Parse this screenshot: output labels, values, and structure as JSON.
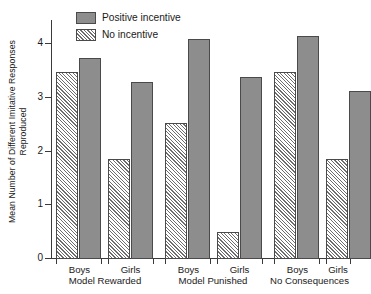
{
  "chart_data": {
    "type": "bar",
    "title": "",
    "subtitle": "",
    "xlabel": "",
    "ylabel": "Mean Number of Different Imitative Responses Reproduced",
    "ylabel_line1": "Mean Number of Different Imitative Responses",
    "ylabel_line2": "Reproduced",
    "ylim": [
      0,
      4.4
    ],
    "ytick_labels": [
      "0",
      "1",
      "2",
      "3",
      "4"
    ],
    "ytick_values": [
      0,
      1,
      2,
      3,
      4
    ],
    "grid": false,
    "legend_position": "top-left-inside",
    "categories": [
      "Boys",
      "Girls",
      "Boys",
      "Girls",
      "Boys",
      "Girls"
    ],
    "groups": [
      {
        "label": "Model Rewarded",
        "categories": [
          "Boys",
          "Girls"
        ]
      },
      {
        "label": "Model Punished",
        "categories": [
          "Boys",
          "Girls"
        ]
      },
      {
        "label": "No Consequences",
        "categories": [
          "Boys",
          "Girls"
        ]
      }
    ],
    "series": [
      {
        "name": "No incentive",
        "pattern": "hatched",
        "color": "#ffffff",
        "hatch_color": "#6e6e6e",
        "values": [
          3.45,
          1.85,
          2.5,
          0.5,
          3.45,
          1.85
        ]
      },
      {
        "name": "Positive incentive",
        "pattern": "solid",
        "color": "#8d8d8d",
        "values": [
          3.7,
          3.25,
          4.05,
          3.35,
          4.1,
          3.1
        ]
      }
    ],
    "bars": [
      {
        "group": "Model Rewarded",
        "category": "Boys",
        "series": "No incentive",
        "value": 3.45
      },
      {
        "group": "Model Rewarded",
        "category": "Boys",
        "series": "Positive incentive",
        "value": 3.7
      },
      {
        "group": "Model Rewarded",
        "category": "Girls",
        "series": "No incentive",
        "value": 1.85
      },
      {
        "group": "Model Rewarded",
        "category": "Girls",
        "series": "Positive incentive",
        "value": 3.25
      },
      {
        "group": "Model Punished",
        "category": "Boys",
        "series": "No incentive",
        "value": 2.5
      },
      {
        "group": "Model Punished",
        "category": "Boys",
        "series": "Positive incentive",
        "value": 4.05
      },
      {
        "group": "Model Punished",
        "category": "Girls",
        "series": "No incentive",
        "value": 0.5
      },
      {
        "group": "Model Punished",
        "category": "Girls",
        "series": "Positive incentive",
        "value": 3.35
      },
      {
        "group": "No Consequences",
        "category": "Boys",
        "series": "No incentive",
        "value": 3.45
      },
      {
        "group": "No Consequences",
        "category": "Boys",
        "series": "Positive incentive",
        "value": 4.1
      },
      {
        "group": "No Consequences",
        "category": "Girls",
        "series": "No incentive",
        "value": 1.85
      },
      {
        "group": "No Consequences",
        "category": "Girls",
        "series": "Positive incentive",
        "value": 3.1
      }
    ],
    "legend": [
      {
        "label": "Positive incentive",
        "pattern": "solid"
      },
      {
        "label": "No incentive",
        "pattern": "hatched"
      }
    ],
    "colors": {
      "solid_fill": "#8d8d8d",
      "hatch_line": "#6e6e6e",
      "bar_border": "#4a4a4a",
      "axis": "#3a3a3a",
      "text": "#1a1a1a",
      "background": "#ffffff"
    }
  }
}
